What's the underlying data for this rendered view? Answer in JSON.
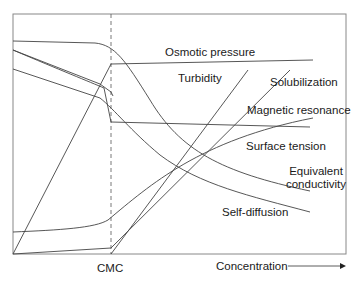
{
  "axis": {
    "x_label": "Concentration",
    "cmc_label": "CMC"
  },
  "curves": [
    {
      "name": "Osmotic pressure",
      "label": "Osmotic pressure"
    },
    {
      "name": "Turbidity",
      "label": "Turbidity"
    },
    {
      "name": "Solubilization",
      "label": "Solubilization"
    },
    {
      "name": "Magnetic resonance",
      "label": "Magnetic resonance"
    },
    {
      "name": "Surface tension",
      "label": "Surface tension"
    },
    {
      "name": "Equivalent conductivity",
      "label_line1": "Equivalent",
      "label_line2": "conductivity"
    },
    {
      "name": "Self-diffusion",
      "label": "Self-diffusion"
    }
  ],
  "colors": {
    "line": "#444444",
    "frame": "#777777",
    "text": "#1a1a1a"
  }
}
